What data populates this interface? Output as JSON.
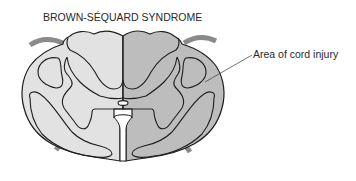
{
  "title": "BROWN-SÉQUARD SYNDROME",
  "annotations": [
    {
      "text": "Area of cord injury",
      "points_to": "right-half-of-spinal-cord"
    }
  ],
  "figure": {
    "regions": [
      {
        "name": "left-half",
        "state": "uninjured"
      },
      {
        "name": "right-half",
        "state": "injured"
      }
    ]
  },
  "colors": {
    "uninjured_fill": "#e2e2e2",
    "injured_fill": "#bdbdbd",
    "outline": "#1e1e1e",
    "nerve_root": "#8a8a8a",
    "background": "#ffffff"
  }
}
